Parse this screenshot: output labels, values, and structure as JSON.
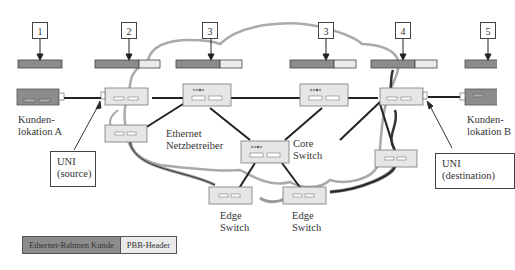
{
  "colors": {
    "customer_frame": "#8c8c8c",
    "pbb_header": "#eaeaea",
    "switch_fill": "#e6e6e6",
    "cloud_outline": "#aaaaaa",
    "link": "#222222"
  },
  "markers": [
    {
      "id": "m1",
      "label": "1"
    },
    {
      "id": "m2",
      "label": "2"
    },
    {
      "id": "m3a",
      "label": "3"
    },
    {
      "id": "m3b",
      "label": "3"
    },
    {
      "id": "m4",
      "label": "4"
    },
    {
      "id": "m5",
      "label": "5"
    }
  ],
  "labels": {
    "customer_a": [
      "Kunden-",
      "lokation A"
    ],
    "customer_b": [
      "Kunden-",
      "lokation B"
    ],
    "uni_source": [
      "UNI",
      "(source)"
    ],
    "uni_destination": [
      "UNI",
      "(destination)"
    ],
    "provider": [
      "Ethernet",
      "Netzbetreiber"
    ],
    "core_switch": [
      "Core",
      "Switch"
    ],
    "edge_switch_left": [
      "Edge",
      "Switch"
    ],
    "edge_switch_right": [
      "Edge",
      "Switch"
    ]
  },
  "legend": {
    "customer_frame": "Ethernet-Rahmen Kunde",
    "pbb_header": "PBB-Header"
  }
}
